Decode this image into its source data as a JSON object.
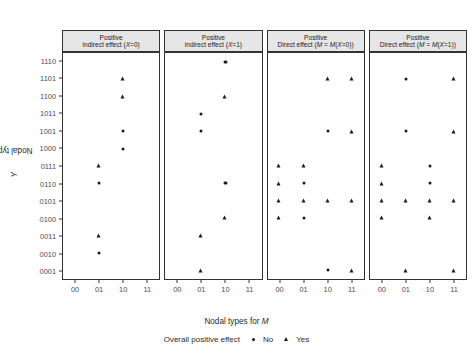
{
  "chart_data": {
    "type": "scatter",
    "title": "",
    "xlabel": "Nodal types for M",
    "ylabel": "Nodal types for Y",
    "x_categories": [
      "00",
      "01",
      "10",
      "11"
    ],
    "y_categories": [
      "0001",
      "0010",
      "0011",
      "0100",
      "0101",
      "0110",
      "0111",
      "1000",
      "1001",
      "1011",
      "1100",
      "1101",
      "1110"
    ],
    "y_categories_top_to_bottom": [
      "1110",
      "1101",
      "1100",
      "1011",
      "1001",
      "1000",
      "0111",
      "0110",
      "0101",
      "0100",
      "0011",
      "0010",
      "0001"
    ],
    "grid": false,
    "legend_position": "bottom",
    "legend_title": "Overall positive effect",
    "legend_entries": [
      {
        "label": "No",
        "marker": "circle"
      },
      {
        "label": "Yes",
        "marker": "triangle"
      }
    ],
    "facets": [
      {
        "id": "indirect-x0",
        "strip_line1": "Positive",
        "strip_line2": "indirect effect (X=0)",
        "points": [
          {
            "x": "10",
            "y": "1101",
            "effect": "Yes"
          },
          {
            "x": "10",
            "y": "1100",
            "effect": "Yes"
          },
          {
            "x": "10",
            "y": "1001",
            "effect": "No"
          },
          {
            "x": "10",
            "y": "1000",
            "effect": "No"
          },
          {
            "x": "01",
            "y": "0111",
            "effect": "Yes"
          },
          {
            "x": "01",
            "y": "0110",
            "effect": "No"
          },
          {
            "x": "01",
            "y": "0011",
            "effect": "Yes"
          },
          {
            "x": "01",
            "y": "0010",
            "effect": "No"
          }
        ]
      },
      {
        "id": "indirect-x1",
        "strip_line1": "Positive",
        "strip_line2": "indirect effect (X=1)",
        "points": [
          {
            "x": "10",
            "y": "1110",
            "effect": "No"
          },
          {
            "x": "10",
            "y": "1100",
            "effect": "Yes"
          },
          {
            "x": "01",
            "y": "1011",
            "effect": "No"
          },
          {
            "x": "01",
            "y": "1001",
            "effect": "No"
          },
          {
            "x": "10",
            "y": "0110",
            "effect": "No"
          },
          {
            "x": "10",
            "y": "0100",
            "effect": "Yes"
          },
          {
            "x": "01",
            "y": "0011",
            "effect": "Yes"
          },
          {
            "x": "01",
            "y": "0001",
            "effect": "Yes"
          }
        ]
      },
      {
        "id": "direct-mx0",
        "strip_line1": "Positive",
        "strip_line2": "Direct effect (M = M(X=0))",
        "points": [
          {
            "x": "10",
            "y": "1101",
            "effect": "Yes"
          },
          {
            "x": "11",
            "y": "1101",
            "effect": "Yes"
          },
          {
            "x": "10",
            "y": "1001",
            "effect": "No"
          },
          {
            "x": "11",
            "y": "1001",
            "effect": "Yes"
          },
          {
            "x": "00",
            "y": "0111",
            "effect": "Yes"
          },
          {
            "x": "01",
            "y": "0111",
            "effect": "Yes"
          },
          {
            "x": "00",
            "y": "0110",
            "effect": "Yes"
          },
          {
            "x": "01",
            "y": "0110",
            "effect": "No"
          },
          {
            "x": "00",
            "y": "0101",
            "effect": "Yes"
          },
          {
            "x": "01",
            "y": "0101",
            "effect": "Yes"
          },
          {
            "x": "10",
            "y": "0101",
            "effect": "Yes"
          },
          {
            "x": "11",
            "y": "0101",
            "effect": "Yes"
          },
          {
            "x": "00",
            "y": "0100",
            "effect": "Yes"
          },
          {
            "x": "01",
            "y": "0100",
            "effect": "No"
          },
          {
            "x": "10",
            "y": "0001",
            "effect": "No"
          },
          {
            "x": "11",
            "y": "0001",
            "effect": "Yes"
          }
        ]
      },
      {
        "id": "direct-mx1",
        "strip_line1": "Positive",
        "strip_line2": "Direct effect (M = M(X=1))",
        "points": [
          {
            "x": "01",
            "y": "1101",
            "effect": "No"
          },
          {
            "x": "11",
            "y": "1101",
            "effect": "Yes"
          },
          {
            "x": "01",
            "y": "1001",
            "effect": "No"
          },
          {
            "x": "11",
            "y": "1001",
            "effect": "Yes"
          },
          {
            "x": "00",
            "y": "0111",
            "effect": "Yes"
          },
          {
            "x": "10",
            "y": "0111",
            "effect": "No"
          },
          {
            "x": "00",
            "y": "0110",
            "effect": "Yes"
          },
          {
            "x": "10",
            "y": "0110",
            "effect": "No"
          },
          {
            "x": "00",
            "y": "0101",
            "effect": "Yes"
          },
          {
            "x": "01",
            "y": "0101",
            "effect": "Yes"
          },
          {
            "x": "10",
            "y": "0101",
            "effect": "Yes"
          },
          {
            "x": "11",
            "y": "0101",
            "effect": "Yes"
          },
          {
            "x": "00",
            "y": "0100",
            "effect": "Yes"
          },
          {
            "x": "10",
            "y": "0100",
            "effect": "Yes"
          },
          {
            "x": "01",
            "y": "0001",
            "effect": "Yes"
          },
          {
            "x": "11",
            "y": "0001",
            "effect": "Yes"
          }
        ]
      }
    ]
  },
  "axis": {
    "y_title_prefix": "Nodal types for ",
    "y_title_italic": "Y",
    "x_title_prefix": "Nodal types for ",
    "x_title_italic": "M"
  },
  "legend": {
    "title": "Overall positive effect",
    "no_label": "No",
    "yes_label": "Yes"
  },
  "colors": {
    "marker": "#1a1a1a",
    "strip_background": "#e6e6e6",
    "panel_border": "#333333",
    "tick_text": "#4d4d4d",
    "title_text": "#2b2b2b"
  }
}
